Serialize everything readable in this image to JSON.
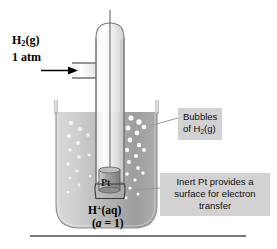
{
  "figure": {
    "background": "#ffffff"
  },
  "inlet": {
    "line1_pre": "H",
    "line1_sub": "2",
    "line1_post": "(g)",
    "line2": "1 atm",
    "arrow_icon": "right-arrow-icon"
  },
  "callouts": {
    "bubbles": {
      "line1": "Bubbles",
      "line2_pre": "of H",
      "line2_sub": "2",
      "line2_post": "(g)",
      "background": "#d2d2d2"
    },
    "inert_pt": {
      "line1": "Inert Pt provides a",
      "line2": "surface for electron",
      "line3": "transfer",
      "background": "#d2d2d2"
    }
  },
  "electrode": {
    "label": "Pt"
  },
  "solution": {
    "species_pre": "H",
    "species_sup": "+",
    "species_post": "(aq)",
    "activity_open": "(",
    "activity_var": "a",
    "activity_eq": " = 1",
    "activity_close": ")"
  },
  "colors": {
    "liquid_light": "#d8d8d8",
    "liquid_dark": "#9b9b9b",
    "glass_stroke": "#6e6e6e",
    "bubble": "#ffffff",
    "electrode_gray": "#8d8d8d",
    "leader_line": "#9a9a9a",
    "table_line": "#4a4a4a"
  }
}
